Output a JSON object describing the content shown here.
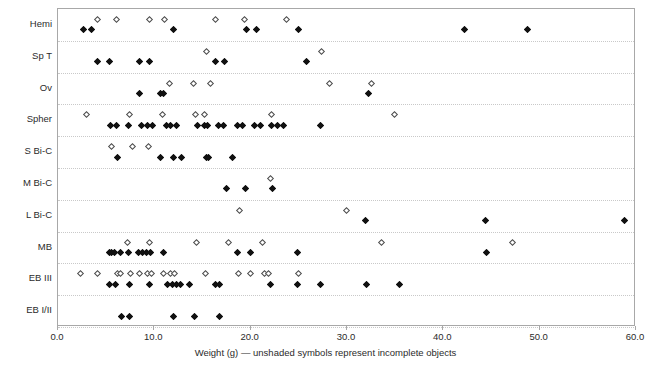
{
  "chart_data": {
    "type": "scatter",
    "title": "",
    "subtitle": "",
    "xlabel": "Weight (g) — unshaded symbols represent incomplete objects",
    "ylabel": "",
    "xlim": [
      0.0,
      60.0
    ],
    "xticks": [
      "0.0",
      "10.0",
      "20.0",
      "30.0",
      "40.0",
      "50.0",
      "60.0"
    ],
    "xtick_values": [
      0.0,
      10.0,
      20.0,
      30.0,
      40.0,
      50.0,
      60.0
    ],
    "grid": "horizontal-dotted-category-separators",
    "legend": "none",
    "annotations": [
      "unshaded symbols represent incomplete objects"
    ],
    "marker_shapes": {
      "filled": "filled diamond (complete object)",
      "open": "open diamond (incomplete object)"
    },
    "categories": [
      "Hemi",
      "Sp T",
      "Ov",
      "Spher",
      "S Bi-C",
      "M Bi-C",
      "L Bi-C",
      "MB",
      "EB III",
      "EB I/II"
    ],
    "series": [
      {
        "name": "Hemi",
        "complete": [
          2.6,
          3.5,
          12.0,
          19.6,
          20.6,
          25.0,
          42.2,
          48.7
        ],
        "incomplete": [
          4.1,
          6.1,
          9.5,
          11.1,
          16.4,
          19.4,
          23.7
        ]
      },
      {
        "name": "Sp T",
        "complete": [
          4.1,
          5.3,
          8.5,
          9.5,
          16.4,
          17.3,
          25.8
        ],
        "incomplete": [
          15.4,
          27.4
        ]
      },
      {
        "name": "Ov",
        "complete": [
          8.5,
          10.6,
          11.0,
          32.2
        ],
        "incomplete": [
          11.6,
          14.1,
          15.8,
          28.2,
          32.5
        ]
      },
      {
        "name": "Spher",
        "complete": [
          5.5,
          6.1,
          7.3,
          8.7,
          9.3,
          9.8,
          11.3,
          11.7,
          12.3,
          14.5,
          15.2,
          15.5,
          16.7,
          17.2,
          18.6,
          19.2,
          20.4,
          21.0,
          22.2,
          22.8,
          23.4,
          27.3
        ],
        "incomplete": [
          3.0,
          7.4,
          10.8,
          14.3,
          15.2,
          22.2,
          34.9
        ]
      },
      {
        "name": "S Bi-C",
        "complete": [
          6.2,
          10.6,
          12.0,
          12.8,
          15.4,
          15.6,
          18.1
        ],
        "incomplete": [
          5.6,
          7.7,
          9.4
        ]
      },
      {
        "name": "M Bi-C",
        "complete": [
          17.5,
          19.5,
          22.3
        ],
        "incomplete": [
          22.1
        ]
      },
      {
        "name": "L Bi-C",
        "complete": [
          31.9,
          44.4,
          58.8
        ],
        "incomplete": [
          18.8,
          29.9
        ]
      },
      {
        "name": "MB",
        "complete": [
          5.3,
          5.6,
          5.9,
          6.5,
          7.3,
          8.4,
          8.8,
          9.2,
          9.6,
          11.0,
          18.6,
          20.0,
          24.9,
          44.5
        ],
        "incomplete": [
          7.2,
          9.5,
          14.4,
          17.7,
          21.2,
          33.6,
          47.2
        ]
      },
      {
        "name": "EB III",
        "complete": [
          5.3,
          6.0,
          7.4,
          9.5,
          11.4,
          11.9,
          12.3,
          12.7,
          13.6,
          16.4,
          16.8,
          22.1,
          24.9,
          27.3,
          32.0,
          35.4
        ],
        "incomplete": [
          2.3,
          4.1,
          6.2,
          6.5,
          7.5,
          8.5,
          9.3,
          9.7,
          11.0,
          11.7,
          12.1,
          15.3,
          18.7,
          20.0,
          21.4,
          21.9,
          25.0
        ]
      },
      {
        "name": "EB I/II",
        "complete": [
          6.6,
          7.4,
          12.0,
          14.2,
          16.8
        ],
        "incomplete": []
      }
    ]
  },
  "axis": {
    "x_title": "Weight (g) — unshaded symbols represent incomplete objects",
    "tick_labels": [
      "0.0",
      "10.0",
      "20.0",
      "30.0",
      "40.0",
      "50.0",
      "60.0"
    ]
  },
  "colors": {
    "frame": "#a8a8a8",
    "gridline": "#c9c9c9",
    "filled_marker": "#111111",
    "open_marker_stroke": "#4b4b4b",
    "text": "#2b2b2b",
    "background": "#ffffff"
  }
}
